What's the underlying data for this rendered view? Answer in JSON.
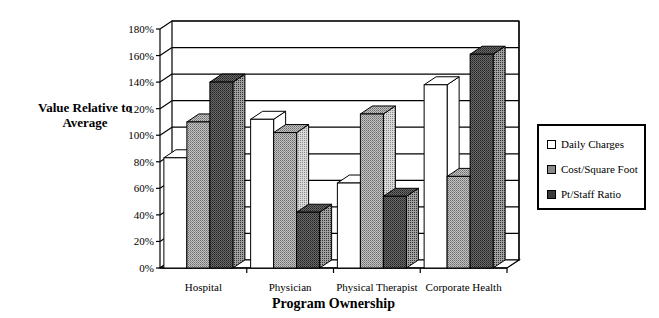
{
  "chart_data": {
    "type": "bar",
    "style": "3d-clustered",
    "title": "",
    "xlabel": "Program Ownership",
    "ylabel": "Value Relative to Average",
    "ylabel_lines": [
      "Value Relative to",
      "Average"
    ],
    "ylim": [
      0,
      180
    ],
    "yticks": [
      "0%",
      "20%",
      "40%",
      "60%",
      "80%",
      "100%",
      "120%",
      "140%",
      "160%",
      "180%"
    ],
    "grid": true,
    "legend_position": "right",
    "categories": [
      "Hospital",
      "Physician",
      "Physical Therapist",
      "Corporate Health"
    ],
    "series": [
      {
        "name": "Daily Charges",
        "values": [
          83,
          112,
          64,
          138
        ],
        "color": "#ffffff"
      },
      {
        "name": "Cost/Square Foot",
        "values": [
          110,
          102,
          116,
          69
        ],
        "color": "#a8a8a8"
      },
      {
        "name": "Pt/Staff Ratio",
        "values": [
          140,
          42,
          54,
          161
        ],
        "color": "#5e5e5e"
      }
    ]
  },
  "legend": {
    "items": [
      "Daily Charges",
      "Cost/Square Foot",
      "Pt/Staff Ratio"
    ]
  }
}
